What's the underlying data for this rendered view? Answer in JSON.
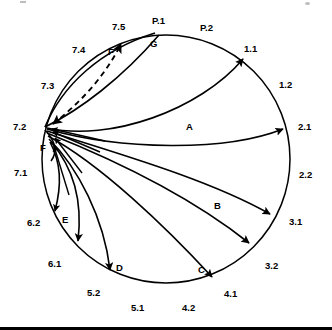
{
  "figure": {
    "type": "circular-arc-diagram",
    "stroke_color": "#000000",
    "background_color": "#ffffff",
    "hub_node": "7.2",
    "circle": {
      "cx": 166,
      "cy": 159,
      "r": 124
    }
  },
  "perimeter_labels": [
    {
      "id": "p-7-5",
      "text": "7.5",
      "x": 112,
      "y": 22
    },
    {
      "id": "p-P-1",
      "text": "P.1",
      "x": 152,
      "y": 16
    },
    {
      "id": "p-P-2",
      "text": "P.2",
      "x": 200,
      "y": 23
    },
    {
      "id": "p-7-4",
      "text": "7.4",
      "x": 72,
      "y": 45
    },
    {
      "id": "p-1-1",
      "text": "1.1",
      "x": 244,
      "y": 44
    },
    {
      "id": "p-7-3",
      "text": "7.3",
      "x": 41,
      "y": 81
    },
    {
      "id": "p-1-2",
      "text": "1.2",
      "x": 279,
      "y": 80
    },
    {
      "id": "p-7-2",
      "text": "7.2",
      "x": 13,
      "y": 122
    },
    {
      "id": "p-2-1",
      "text": "2.1",
      "x": 298,
      "y": 122
    },
    {
      "id": "p-7-1",
      "text": "7.1",
      "x": 14,
      "y": 168
    },
    {
      "id": "p-2-2",
      "text": "2.2",
      "x": 299,
      "y": 170
    },
    {
      "id": "p-6-2",
      "text": "6.2",
      "x": 27,
      "y": 218
    },
    {
      "id": "p-3-1",
      "text": "3.1",
      "x": 289,
      "y": 217
    },
    {
      "id": "p-6-1",
      "text": "6.1",
      "x": 48,
      "y": 259
    },
    {
      "id": "p-3-2",
      "text": "3.2",
      "x": 265,
      "y": 261
    },
    {
      "id": "p-5-2",
      "text": "5.2",
      "x": 87,
      "y": 288
    },
    {
      "id": "p-4-1",
      "text": "4.1",
      "x": 224,
      "y": 289
    },
    {
      "id": "p-5-1",
      "text": "5.1",
      "x": 131,
      "y": 303
    },
    {
      "id": "p-4-2",
      "text": "4.2",
      "x": 182,
      "y": 303
    }
  ],
  "arc_labels": [
    {
      "id": "a-G",
      "text": "G",
      "x": 150,
      "y": 39
    },
    {
      "id": "a-F-top",
      "text": "F",
      "x": 108,
      "y": 47
    },
    {
      "id": "a-A",
      "text": "A",
      "x": 186,
      "y": 122
    },
    {
      "id": "a-F-hub",
      "text": "F",
      "x": 40,
      "y": 143
    },
    {
      "id": "a-B",
      "text": "B",
      "x": 214,
      "y": 201
    },
    {
      "id": "a-E",
      "text": "E",
      "x": 62,
      "y": 215
    },
    {
      "id": "a-C",
      "text": "C",
      "x": 198,
      "y": 265
    },
    {
      "id": "a-D",
      "text": "D",
      "x": 116,
      "y": 263
    }
  ],
  "arcs": [
    {
      "id": "arc-G",
      "label": "G",
      "from": "7.2",
      "to": "P.1",
      "style": "solid",
      "arrow": "none"
    },
    {
      "id": "arc-F",
      "label": "F",
      "from": "7.2",
      "to": "7.5",
      "style": "dashed",
      "arrow": "both"
    },
    {
      "id": "arc-11",
      "label": "",
      "from": "7.2",
      "to": "1.1",
      "style": "solid",
      "arrow": "end"
    },
    {
      "id": "arc-A",
      "label": "A",
      "from": "7.2",
      "to": "2.1",
      "style": "solid",
      "arrow": "end"
    },
    {
      "id": "arc-B",
      "label": "B",
      "from": "7.2",
      "to": "3.1",
      "style": "solid",
      "arrow": "end"
    },
    {
      "id": "arc-32",
      "label": "",
      "from": "7.2",
      "to": "3.2",
      "style": "solid",
      "arrow": "end"
    },
    {
      "id": "arc-C",
      "label": "C",
      "from": "7.2",
      "to": "4.1",
      "style": "solid",
      "arrow": "end"
    },
    {
      "id": "arc-D",
      "label": "D",
      "from": "7.2",
      "to": "5.2",
      "style": "solid",
      "arrow": "end"
    },
    {
      "id": "arc-E1",
      "label": "E",
      "from": "7.2",
      "to": "6.1",
      "style": "solid",
      "arrow": "end"
    },
    {
      "id": "arc-E2",
      "label": "E",
      "from": "7.2",
      "to": "6.2",
      "style": "solid",
      "arrow": "end"
    },
    {
      "id": "arc-Fl",
      "label": "F",
      "from": "7.2",
      "to": "7.1",
      "style": "solid",
      "arrow": "end"
    }
  ]
}
